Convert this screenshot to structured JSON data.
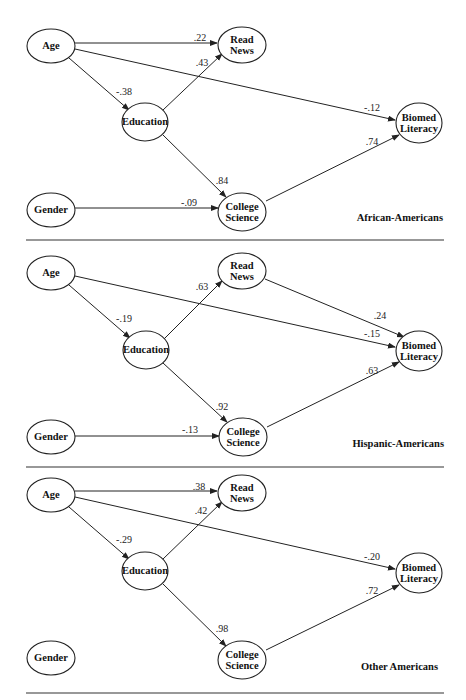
{
  "figure": {
    "arrow_color": "#222222",
    "panels": [
      {
        "id": "african-americans",
        "group_label": "African-Americans",
        "group_label_pos": [
          443,
          221
        ],
        "nodes": [
          {
            "id": "age",
            "lines": [
              "Age"
            ],
            "cx": 51,
            "cy": 46,
            "rx": 24,
            "ry": 17
          },
          {
            "id": "read-news",
            "lines": [
              "Read",
              "News"
            ],
            "cx": 242,
            "cy": 45,
            "rx": 24,
            "ry": 18
          },
          {
            "id": "education",
            "lines": [
              "Education"
            ],
            "cx": 145,
            "cy": 122,
            "rx": 23,
            "ry": 19
          },
          {
            "id": "biomed-literacy",
            "lines": [
              "Biomed",
              "Literacy"
            ],
            "cx": 419,
            "cy": 123,
            "rx": 23,
            "ry": 20
          },
          {
            "id": "gender",
            "lines": [
              "Gender"
            ],
            "cx": 51,
            "cy": 210,
            "rx": 24,
            "ry": 17
          },
          {
            "id": "college-science",
            "lines": [
              "College",
              "Science"
            ],
            "cx": 242,
            "cy": 212,
            "rx": 24,
            "ry": 19
          }
        ],
        "edges": [
          {
            "from": "age",
            "to": "read-news",
            "coef": ".22",
            "x1": 75,
            "y1": 43,
            "x2": 217,
            "y2": 43,
            "lx": 200,
            "ly": 41
          },
          {
            "from": "age",
            "to": "biomed-literacy",
            "coef": "-.12",
            "x1": 75,
            "y1": 49,
            "x2": 395,
            "y2": 120,
            "lx": 372,
            "ly": 111
          },
          {
            "from": "age",
            "to": "education",
            "coef": "-.38",
            "x1": 69,
            "y1": 58,
            "x2": 129,
            "y2": 110,
            "lx": 124,
            "ly": 95
          },
          {
            "from": "education",
            "to": "read-news",
            "coef": ".43",
            "x1": 163,
            "y1": 110,
            "x2": 222,
            "y2": 54,
            "lx": 202,
            "ly": 66
          },
          {
            "from": "education",
            "to": "college-science",
            "coef": ".84",
            "x1": 163,
            "y1": 135,
            "x2": 226,
            "y2": 197,
            "lx": 222,
            "ly": 184
          },
          {
            "from": "college-science",
            "to": "biomed-literacy",
            "coef": ".74",
            "x1": 266,
            "y1": 201,
            "x2": 399,
            "y2": 135,
            "lx": 372,
            "ly": 145
          },
          {
            "from": "gender",
            "to": "college-science",
            "coef": "-.09",
            "x1": 75,
            "y1": 208,
            "x2": 218,
            "y2": 208,
            "lx": 189,
            "ly": 206
          }
        ]
      },
      {
        "id": "hispanic-americans",
        "group_label": "Hispanic-Americans",
        "group_label_pos": [
          444,
          447
        ],
        "nodes": [
          {
            "id": "age",
            "lines": [
              "Age"
            ],
            "cx": 51,
            "cy": 273,
            "rx": 24,
            "ry": 17
          },
          {
            "id": "read-news",
            "lines": [
              "Read",
              "News"
            ],
            "cx": 242,
            "cy": 271,
            "rx": 24,
            "ry": 18
          },
          {
            "id": "education",
            "lines": [
              "Education"
            ],
            "cx": 146,
            "cy": 350,
            "rx": 23,
            "ry": 19
          },
          {
            "id": "biomed-literacy",
            "lines": [
              "Biomed",
              "Literacy"
            ],
            "cx": 419,
            "cy": 351,
            "rx": 23,
            "ry": 20
          },
          {
            "id": "gender",
            "lines": [
              "Gender"
            ],
            "cx": 51,
            "cy": 437,
            "rx": 24,
            "ry": 17
          },
          {
            "id": "college-science",
            "lines": [
              "College",
              "Science"
            ],
            "cx": 243,
            "cy": 437,
            "rx": 24,
            "ry": 19
          }
        ],
        "edges": [
          {
            "from": "age",
            "to": "biomed-literacy",
            "coef": "-.15",
            "x1": 75,
            "y1": 276,
            "x2": 395,
            "y2": 347,
            "lx": 372,
            "ly": 337
          },
          {
            "from": "age",
            "to": "education",
            "coef": "-.19",
            "x1": 69,
            "y1": 285,
            "x2": 130,
            "y2": 338,
            "lx": 124,
            "ly": 322
          },
          {
            "from": "education",
            "to": "read-news",
            "coef": ".63",
            "x1": 164,
            "y1": 339,
            "x2": 222,
            "y2": 281,
            "lx": 202,
            "ly": 290
          },
          {
            "from": "read-news",
            "to": "biomed-literacy",
            "coef": ".24",
            "x1": 265,
            "y1": 279,
            "x2": 404,
            "y2": 337,
            "lx": 380,
            "ly": 319
          },
          {
            "from": "education",
            "to": "college-science",
            "coef": ".92",
            "x1": 163,
            "y1": 363,
            "x2": 227,
            "y2": 422,
            "lx": 222,
            "ly": 410
          },
          {
            "from": "college-science",
            "to": "biomed-literacy",
            "coef": ".63",
            "x1": 267,
            "y1": 427,
            "x2": 399,
            "y2": 362,
            "lx": 372,
            "ly": 374
          },
          {
            "from": "gender",
            "to": "college-science",
            "coef": "-.13",
            "x1": 75,
            "y1": 436,
            "x2": 219,
            "y2": 436,
            "lx": 190,
            "ly": 433
          }
        ]
      },
      {
        "id": "other-americans",
        "group_label": "Other Americans",
        "group_label_pos": [
          438,
          670
        ],
        "nodes": [
          {
            "id": "age",
            "lines": [
              "Age"
            ],
            "cx": 51,
            "cy": 495,
            "rx": 24,
            "ry": 17
          },
          {
            "id": "read-news",
            "lines": [
              "Read",
              "News"
            ],
            "cx": 242,
            "cy": 493,
            "rx": 24,
            "ry": 18
          },
          {
            "id": "education",
            "lines": [
              "Education"
            ],
            "cx": 145,
            "cy": 571,
            "rx": 23,
            "ry": 19
          },
          {
            "id": "biomed-literacy",
            "lines": [
              "Biomed",
              "Literacy"
            ],
            "cx": 419,
            "cy": 573,
            "rx": 23,
            "ry": 20
          },
          {
            "id": "gender",
            "lines": [
              "Gender"
            ],
            "cx": 51,
            "cy": 658,
            "rx": 24,
            "ry": 17
          },
          {
            "id": "college-science",
            "lines": [
              "College",
              "Science"
            ],
            "cx": 242,
            "cy": 660,
            "rx": 24,
            "ry": 19
          }
        ],
        "edges": [
          {
            "from": "age",
            "to": "read-news",
            "coef": ".38",
            "x1": 75,
            "y1": 491,
            "x2": 217,
            "y2": 491,
            "lx": 199,
            "ly": 490
          },
          {
            "from": "age",
            "to": "biomed-literacy",
            "coef": "-.20",
            "x1": 75,
            "y1": 497,
            "x2": 395,
            "y2": 569,
            "lx": 372,
            "ly": 560
          },
          {
            "from": "age",
            "to": "education",
            "coef": "-.29",
            "x1": 69,
            "y1": 507,
            "x2": 129,
            "y2": 559,
            "lx": 124,
            "ly": 543
          },
          {
            "from": "education",
            "to": "read-news",
            "coef": ".42",
            "x1": 163,
            "y1": 559,
            "x2": 222,
            "y2": 502,
            "lx": 201,
            "ly": 514
          },
          {
            "from": "education",
            "to": "college-science",
            "coef": ".98",
            "x1": 163,
            "y1": 584,
            "x2": 226,
            "y2": 646,
            "lx": 222,
            "ly": 632
          },
          {
            "from": "college-science",
            "to": "biomed-literacy",
            "coef": ".72",
            "x1": 266,
            "y1": 650,
            "x2": 399,
            "y2": 585,
            "lx": 372,
            "ly": 594
          }
        ]
      }
    ],
    "dividers": [
      {
        "x1": 26,
        "x2": 444,
        "y": 240
      },
      {
        "x1": 26,
        "x2": 444,
        "y": 467
      },
      {
        "x1": 26,
        "x2": 444,
        "y": 693
      }
    ]
  }
}
